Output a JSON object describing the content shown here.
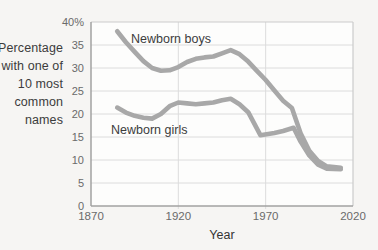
{
  "colors": {
    "line": "#a8a8a8",
    "grid": "#dcdcdc",
    "border": "#cccccc",
    "axis": "#a2a2a2",
    "plot_bg": "#fdfdfc",
    "page_bg": "#f6f5f3",
    "label_text": "#3c3c3c",
    "tick_text": "#6a6a6a"
  },
  "chart_data": {
    "type": "line",
    "xlabel": "Year",
    "ylabel_lines": [
      "Percentage",
      "with one of",
      "10 most",
      "common",
      "names"
    ],
    "xlim": [
      1870,
      2020
    ],
    "ylim": [
      0,
      40
    ],
    "grid": {
      "horizontal": true,
      "vertical_at": [
        1920,
        1970
      ]
    },
    "x_ticks": [
      {
        "label": "1870",
        "value": 1870
      },
      {
        "label": "1920",
        "value": 1920
      },
      {
        "label": "1970",
        "value": 1970
      },
      {
        "label": "2020",
        "value": 2020
      }
    ],
    "y_ticks": [
      {
        "label": "40%",
        "value": 40
      },
      {
        "label": "35",
        "value": 35
      },
      {
        "label": "30",
        "value": 30
      },
      {
        "label": "25",
        "value": 25
      },
      {
        "label": "20",
        "value": 20
      },
      {
        "label": "15",
        "value": 15
      },
      {
        "label": "10",
        "value": 10
      },
      {
        "label": "5",
        "value": 5
      },
      {
        "label": "0",
        "value": 0
      }
    ],
    "series": [
      {
        "name": "Newborn boys",
        "points": [
          [
            1885,
            38.0
          ],
          [
            1890,
            35.6
          ],
          [
            1895,
            33.5
          ],
          [
            1900,
            31.5
          ],
          [
            1905,
            30.0
          ],
          [
            1910,
            29.4
          ],
          [
            1915,
            29.5
          ],
          [
            1920,
            30.2
          ],
          [
            1925,
            31.3
          ],
          [
            1930,
            32.0
          ],
          [
            1935,
            32.3
          ],
          [
            1940,
            32.5
          ],
          [
            1945,
            33.2
          ],
          [
            1950,
            33.9
          ],
          [
            1955,
            33.0
          ],
          [
            1960,
            31.4
          ],
          [
            1965,
            29.4
          ],
          [
            1970,
            27.4
          ],
          [
            1975,
            25.1
          ],
          [
            1980,
            22.9
          ],
          [
            1985,
            21.3
          ],
          [
            1990,
            15.8
          ],
          [
            1995,
            12.0
          ],
          [
            2000,
            9.8
          ],
          [
            2005,
            8.6
          ],
          [
            2013,
            8.3
          ]
        ]
      },
      {
        "name": "Newborn girls",
        "points": [
          [
            1885,
            21.4
          ],
          [
            1890,
            20.3
          ],
          [
            1895,
            19.6
          ],
          [
            1900,
            19.2
          ],
          [
            1905,
            19.0
          ],
          [
            1910,
            20.0
          ],
          [
            1915,
            21.7
          ],
          [
            1920,
            22.5
          ],
          [
            1925,
            22.3
          ],
          [
            1930,
            22.1
          ],
          [
            1935,
            22.3
          ],
          [
            1940,
            22.5
          ],
          [
            1945,
            23.0
          ],
          [
            1950,
            23.3
          ],
          [
            1955,
            22.1
          ],
          [
            1960,
            20.4
          ],
          [
            1967,
            15.4
          ],
          [
            1975,
            15.9
          ],
          [
            1980,
            16.3
          ],
          [
            1986,
            17.0
          ],
          [
            1990,
            14.0
          ],
          [
            1995,
            11.0
          ],
          [
            2000,
            9.0
          ],
          [
            2005,
            8.1
          ],
          [
            2013,
            8.0
          ]
        ]
      }
    ]
  }
}
